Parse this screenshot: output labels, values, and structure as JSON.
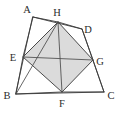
{
  "figure": {
    "width": 124,
    "height": 115,
    "background_color": "#ffffff",
    "stroke_color": "#3a3a3a",
    "shade_color": "#d8d8d8",
    "label_color": "#2b2b2b"
  },
  "points": {
    "A": {
      "label": "A",
      "x": 33,
      "y": 17,
      "label_x": 28,
      "label_y": 13
    },
    "B": {
      "label": "B",
      "x": 16,
      "y": 94,
      "label_x": 5,
      "label_y": 97
    },
    "C": {
      "label": "C",
      "x": 104,
      "y": 92,
      "label_x": 107,
      "label_y": 99
    },
    "D": {
      "label": "D",
      "x": 82,
      "y": 29,
      "label_x": 85,
      "label_y": 32
    },
    "E": {
      "label": "E",
      "x": 23,
      "y": 57,
      "label_x": 11,
      "label_y": 60
    },
    "F": {
      "label": "F",
      "x": 62,
      "y": 92,
      "label_x": 59,
      "label_y": 107
    },
    "G": {
      "label": "G",
      "x": 93,
      "y": 60,
      "label_x": 96,
      "label_y": 64
    },
    "H": {
      "label": "H",
      "x": 58,
      "y": 22,
      "label_x": 54,
      "label_y": 18
    }
  },
  "edges": {
    "outer_quadrilateral": [
      "A",
      "D",
      "C",
      "B"
    ],
    "inner_square": [
      "E",
      "H",
      "G",
      "F"
    ],
    "diagonals": [
      {
        "from": "E",
        "to": "G"
      },
      {
        "from": "H",
        "to": "F"
      },
      {
        "from": "B",
        "to": "H"
      }
    ],
    "outer_to_inner": [
      {
        "from": "A",
        "to": "E"
      },
      {
        "from": "A",
        "to": "H"
      },
      {
        "from": "D",
        "to": "H"
      },
      {
        "from": "D",
        "to": "G"
      },
      {
        "from": "B",
        "to": "E"
      },
      {
        "from": "B",
        "to": "F"
      },
      {
        "from": "C",
        "to": "F"
      },
      {
        "from": "C",
        "to": "G"
      }
    ]
  },
  "shaded_region": {
    "name": "inscribed-square-EHGF",
    "vertices": [
      "E",
      "H",
      "G",
      "F"
    ],
    "fill": "#d8d8d8"
  }
}
